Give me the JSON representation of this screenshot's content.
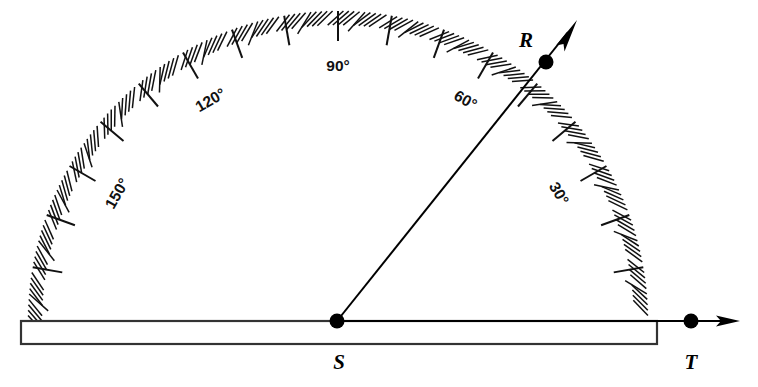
{
  "figure": {
    "type": "geometry-diagram",
    "background": "#ffffff",
    "ink_color": "#111111"
  },
  "protractor": {
    "center": {
      "x": 338,
      "y": 321
    },
    "radius": 310,
    "arc_span_degrees": 180,
    "tick_interval_degrees": 1,
    "major_tick_interval_degrees": 10,
    "scale_labels": [
      {
        "text": "150°",
        "angle": 150
      },
      {
        "text": "120°",
        "angle": 120
      },
      {
        "text": "90°",
        "angle": 90
      },
      {
        "text": "60°",
        "angle": 60
      },
      {
        "text": "30°",
        "angle": 30
      }
    ],
    "base": {
      "x": 21,
      "y": 321,
      "width": 636,
      "height": 23
    }
  },
  "points": [
    {
      "name": "R",
      "label": "R",
      "x": 546,
      "y": 62,
      "label_x": 526,
      "label_y": 42
    },
    {
      "name": "S",
      "label": "S",
      "x": 337,
      "y": 321,
      "label_x": 339,
      "label_y": 364
    },
    {
      "name": "T",
      "label": "T",
      "x": 691,
      "y": 321,
      "label_x": 691,
      "label_y": 364
    }
  ],
  "rays": [
    {
      "name": "ray-SR",
      "from": "S",
      "through": "R",
      "angle_degrees": 51,
      "tip_x": 577,
      "tip_y": 20
    },
    {
      "name": "ray-ST",
      "from": "S",
      "through": "T",
      "angle_degrees": 0,
      "tip_x": 740,
      "tip_y": 321
    }
  ],
  "measured_angle": {
    "vertex": "S",
    "arms": [
      "R",
      "T"
    ],
    "reading_degrees": 51
  }
}
